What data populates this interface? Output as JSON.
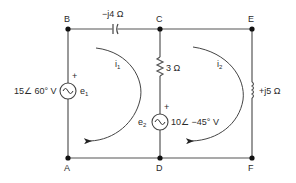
{
  "diagram": {
    "type": "circuit",
    "nodes": [
      {
        "id": "B",
        "label": "B"
      },
      {
        "id": "C",
        "label": "C"
      },
      {
        "id": "E",
        "label": "E"
      },
      {
        "id": "A",
        "label": "A"
      },
      {
        "id": "D",
        "label": "D"
      },
      {
        "id": "F",
        "label": "F"
      }
    ],
    "components": {
      "capacitor": {
        "label": "−j4 Ω",
        "between": "B-C"
      },
      "resistor": {
        "label": "3 Ω",
        "between": "C-D"
      },
      "inductor": {
        "label": "+j5 Ω",
        "between": "E-F"
      },
      "source1": {
        "label": "15∠ 60° V",
        "name": "e",
        "subscript": "1",
        "polarity": "+",
        "between": "B-A"
      },
      "source2": {
        "label": "10∠ −45° V",
        "name": "e",
        "subscript": "2",
        "polarity": "+",
        "between": "C-D"
      }
    },
    "mesh_currents": [
      {
        "name": "i",
        "subscript": "1",
        "direction": "clockwise"
      },
      {
        "name": "i",
        "subscript": "2",
        "direction": "clockwise"
      }
    ],
    "colors": {
      "wire": "#555555",
      "text": "#2a2a2a"
    }
  }
}
